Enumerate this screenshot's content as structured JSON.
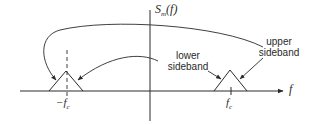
{
  "diagram": {
    "y_axis_label": {
      "main": "S",
      "sub": "m",
      "arg": "(f)"
    },
    "x_axis_label": "f",
    "ticks": {
      "neg_carrier": {
        "prefix": "−f",
        "sub": "c"
      },
      "pos_carrier": {
        "prefix": "f",
        "sub": "c"
      }
    },
    "annotations": {
      "lower_sideband": [
        "lower",
        "sideband"
      ],
      "upper_sideband": [
        "upper",
        "sideband"
      ]
    },
    "colors": {
      "stroke": "#2a2a2a",
      "background": "#ffffff"
    }
  }
}
